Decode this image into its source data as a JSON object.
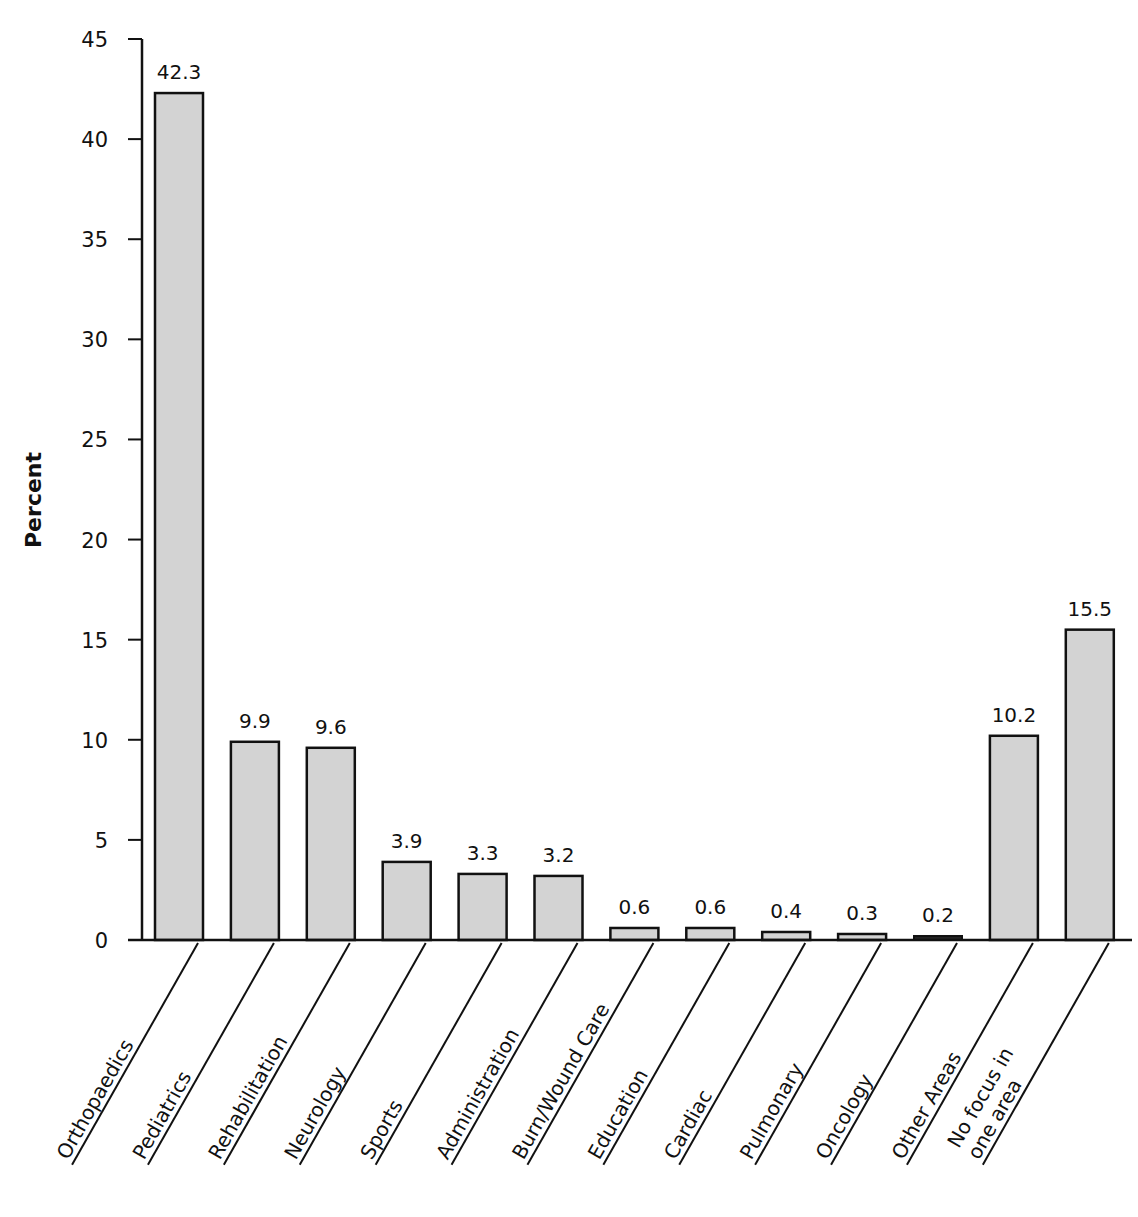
{
  "chart_data": {
    "type": "bar",
    "title": "",
    "xlabel": "",
    "ylabel": "Percent",
    "ylim": [
      0,
      45
    ],
    "yticks": [
      0,
      5,
      10,
      15,
      20,
      25,
      30,
      35,
      40,
      45
    ],
    "grid": false,
    "legend": null,
    "categories": [
      "Orthopaedics",
      "Pediatrics",
      "Rehabilitation",
      "Neurology",
      "Sports",
      "Administration",
      "Burn/Wound Care",
      "Education",
      "Cardiac",
      "Pulmonary",
      "Oncology",
      "Other Areas",
      "No focus in one area"
    ],
    "category_label_lines": [
      [
        "Orthopaedics"
      ],
      [
        "Pediatrics"
      ],
      [
        "Rehabilitation"
      ],
      [
        "Neurology"
      ],
      [
        "Sports"
      ],
      [
        "Administration"
      ],
      [
        "Burn/Wound Care"
      ],
      [
        "Education"
      ],
      [
        "Cardiac"
      ],
      [
        "Pulmonary"
      ],
      [
        "Oncology"
      ],
      [
        "Other Areas"
      ],
      [
        "No focus in",
        "one area"
      ]
    ],
    "values": [
      42.3,
      9.9,
      9.6,
      3.9,
      3.3,
      3.2,
      0.6,
      0.6,
      0.4,
      0.3,
      0.2,
      10.2,
      15.5
    ],
    "value_labels": [
      "42.3",
      "9.9",
      "9.6",
      "3.9",
      "3.3",
      "3.2",
      "0.6",
      "0.6",
      "0.4",
      "0.3",
      "0.2",
      "10.2",
      "15.5"
    ]
  },
  "colors": {
    "bar_fill": "#d3d3d3",
    "bar_stroke": "#111111",
    "axis": "#111111"
  }
}
